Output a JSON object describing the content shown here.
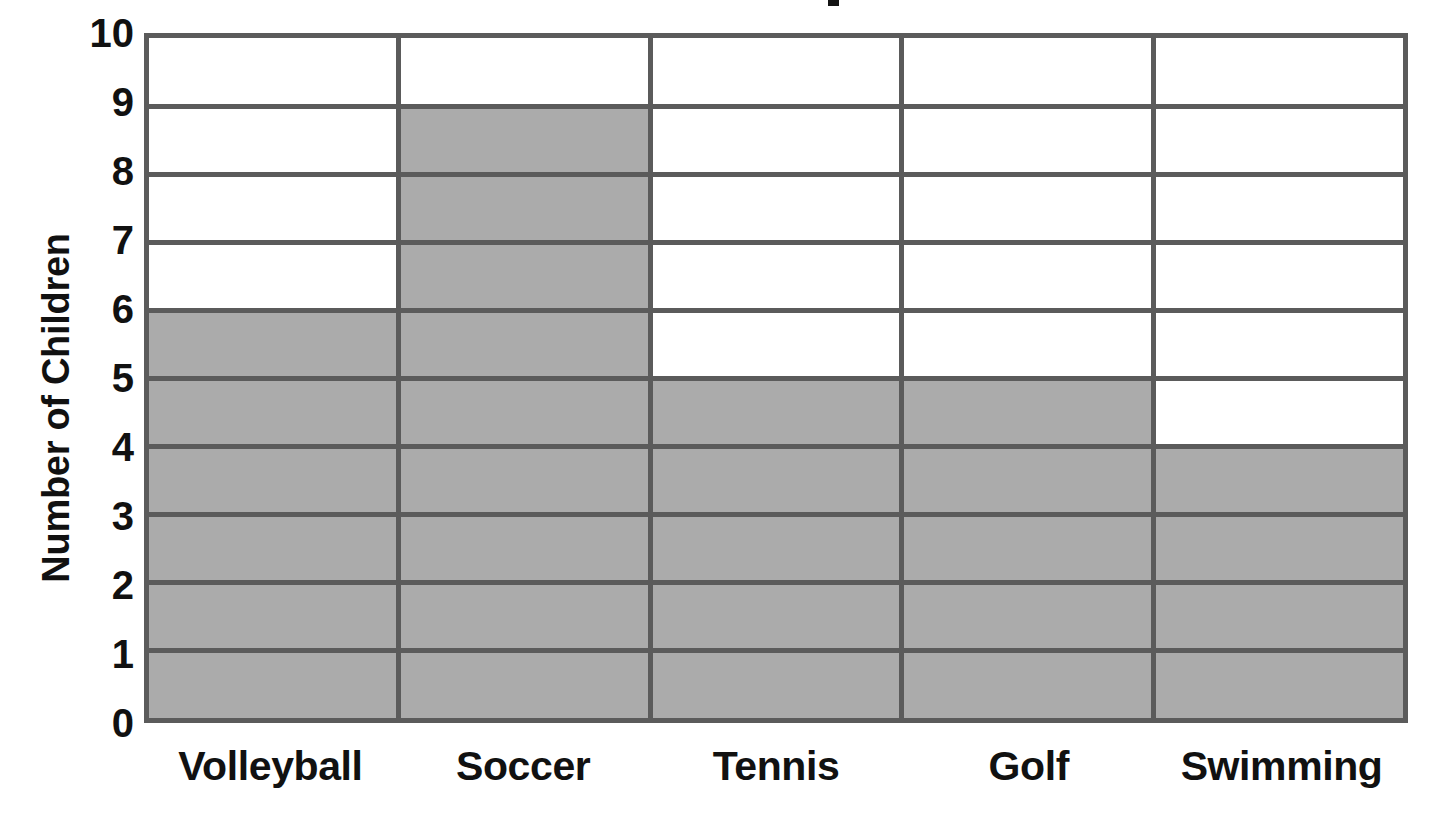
{
  "chart_data": {
    "type": "bar",
    "title": "",
    "xlabel": "",
    "ylabel": "Number of Children",
    "categories": [
      "Volleyball",
      "Soccer",
      "Tennis",
      "Golf",
      "Swimming"
    ],
    "values": [
      6,
      9,
      5,
      5,
      4
    ],
    "ylim": [
      0,
      10
    ],
    "ytick_labels": [
      "10",
      "9",
      "8",
      "7",
      "6",
      "5",
      "4",
      "3",
      "2",
      "1",
      "0"
    ],
    "ytick_values": [
      10,
      9,
      8,
      7,
      6,
      5,
      4,
      3,
      2,
      1,
      0
    ],
    "grid": true,
    "legend": "none",
    "orientation": "vertical",
    "bar_fill_color": "#ababab",
    "grid_color": "#5b5b5b",
    "text_color": "#111111",
    "background_color": "#ffffff"
  },
  "title_fragment": {
    "visible": true,
    "text": ""
  }
}
